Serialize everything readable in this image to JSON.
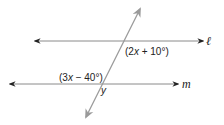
{
  "diagram": {
    "type": "parallel-lines-transversal",
    "colors": {
      "line": "#8a8a8a",
      "arrowhead_dark": "#222222",
      "transversal": "#9a9a9a",
      "text": "#222222"
    },
    "lines": [
      {
        "id": "l",
        "label": "ℓ",
        "x1": 35,
        "y1": 41,
        "x2": 203,
        "y2": 41
      },
      {
        "id": "m",
        "label": "m",
        "x1": 10,
        "y1": 84,
        "x2": 178,
        "y2": 84
      }
    ],
    "transversal": {
      "x1": 140,
      "y1": 8,
      "x2": 86,
      "y2": 118
    },
    "angle_labels": [
      {
        "id": "angle-top",
        "text": "(2x + 10°)",
        "pre": "(2",
        "var": "x",
        "post": " + 10°)"
      },
      {
        "id": "angle-left",
        "text": "(3x − 40°)",
        "pre": "(3",
        "var": "x",
        "post": " − 40°)"
      },
      {
        "id": "angle-y",
        "text": "y"
      }
    ]
  }
}
